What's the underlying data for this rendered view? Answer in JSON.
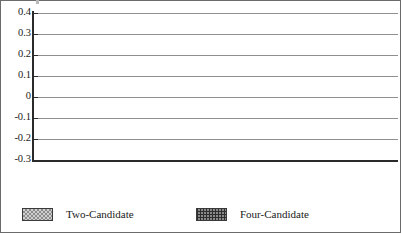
{
  "chart_data": {
    "type": "bar",
    "title": "",
    "xlabel": "",
    "ylabel": "",
    "categories": [
      "Endorsement",
      "Party",
      "Ideology",
      "Appearance"
    ],
    "series": [
      {
        "name": "Two-Candidate",
        "values": [
          0.1,
          -0.235,
          -0.13,
          -0.04
        ],
        "pattern": "light-checkerboard",
        "color": "#cfcfcf"
      },
      {
        "name": "Four-Candidate",
        "values": [
          0.36,
          0.195,
          0.12,
          -0.015
        ],
        "pattern": "dark-crosshatch",
        "color": "#8a8a8a"
      }
    ],
    "ylim": [
      -0.3,
      0.4
    ],
    "ytick_values": [
      0.4,
      0.3,
      0.2,
      0.1,
      0,
      -0.1,
      -0.2,
      -0.3
    ],
    "ytick_labels": [
      "0.4",
      "0.3",
      "0.2",
      "0.1",
      "0",
      "-0.1",
      "-0.2",
      "-0.3"
    ],
    "ytick_step": 0.1,
    "grid": true,
    "grid_axis": "y",
    "zero_line": 0,
    "legend_position": "bottom",
    "category_label_layout": "staggered-two-rows",
    "category_label_rows": [
      "low",
      "high",
      "low",
      "high"
    ]
  },
  "axis": {
    "y_labels": [
      "0.4",
      "0.3",
      "0.2",
      "0.1",
      "0",
      "-0.1",
      "-0.2",
      "-0.3"
    ]
  },
  "categories": [
    {
      "label": "Endorsement"
    },
    {
      "label": "Party"
    },
    {
      "label": "Ideology"
    },
    {
      "label": "Appearance"
    }
  ],
  "legend": {
    "items": [
      {
        "label": "Two-Candidate",
        "swatch": "light-checkerboard-swatch"
      },
      {
        "label": "Four-Candidate",
        "swatch": "dark-crosshatch-swatch"
      }
    ]
  }
}
